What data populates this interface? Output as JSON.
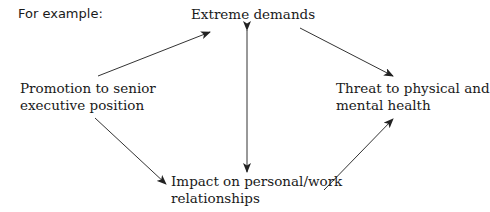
{
  "intro": "For example:",
  "nodes": {
    "demands": {
      "label": "Extreme demands"
    },
    "promotion": {
      "lines": [
        "Promotion to senior",
        "executive position"
      ]
    },
    "threat": {
      "lines": [
        "Threat to physical and",
        "mental health"
      ]
    },
    "impact": {
      "lines": [
        "Impact on personal/work",
        "relationships"
      ]
    }
  },
  "edges": [
    {
      "from": "promotion",
      "to": "demands"
    },
    {
      "from": "demands",
      "to": "threat"
    },
    {
      "from": "demands",
      "to": "impact",
      "bidirectional": true
    },
    {
      "from": "promotion",
      "to": "impact"
    },
    {
      "from": "impact",
      "to": "threat"
    }
  ],
  "colors": {
    "text": "#1a1a1a",
    "arrow": "#333333"
  }
}
